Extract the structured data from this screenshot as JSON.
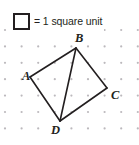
{
  "figure": {
    "width": 139,
    "height": 145,
    "background_color": "#ffffff",
    "ink_color": "#231f20",
    "dot_color": "#bcb9bd"
  },
  "legend": {
    "swatch_name": "unit-square",
    "swatch_border_color": "#231f20",
    "swatch_fill_color": "#ffffff",
    "text": "= 1 square unit"
  },
  "grid": {
    "type": "dot-grid",
    "origin_x": 5,
    "origin_y": 30,
    "spacing_x": 16.6,
    "spacing_y": 16.4,
    "cols": 9,
    "rows": 7,
    "dot_radius": 1.1
  },
  "chart_data": {
    "type": "scatter",
    "xlabel": "",
    "ylabel": "",
    "grid": true,
    "legend_entries": [
      "= 1 square unit"
    ],
    "vertices": [
      {
        "name": "A",
        "px": 30,
        "py": 77,
        "grid_x": 1.5,
        "grid_y": 2.9
      },
      {
        "name": "B",
        "px": 76,
        "py": 48,
        "grid_x": 4.3,
        "grid_y": 1.1
      },
      {
        "name": "C",
        "px": 107,
        "py": 88,
        "grid_x": 6.1,
        "grid_y": 3.5
      },
      {
        "name": "D",
        "px": 60,
        "py": 121,
        "grid_x": 3.3,
        "grid_y": 5.5
      }
    ],
    "edges": [
      {
        "name": "AB",
        "from": "A",
        "to": "B"
      },
      {
        "name": "BC",
        "from": "B",
        "to": "C"
      },
      {
        "name": "CD",
        "from": "C",
        "to": "D"
      },
      {
        "name": "DA",
        "from": "D",
        "to": "A"
      },
      {
        "name": "BD",
        "from": "B",
        "to": "D"
      }
    ],
    "labels": [
      {
        "name": "A",
        "px": 22,
        "py": 70
      },
      {
        "name": "B",
        "px": 75,
        "py": 32
      },
      {
        "name": "C",
        "px": 111,
        "py": 89
      },
      {
        "name": "D",
        "px": 51,
        "py": 124
      }
    ]
  }
}
